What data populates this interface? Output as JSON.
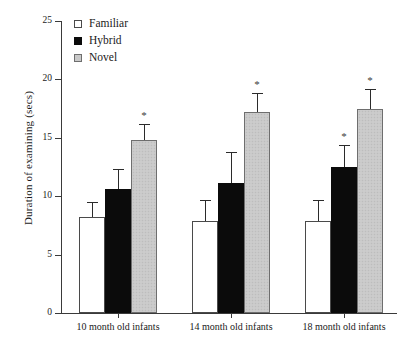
{
  "chart_data": {
    "type": "bar",
    "title": "",
    "xlabel": "",
    "ylabel": "Duration of examining (secs)",
    "ylim": [
      0,
      25
    ],
    "yticks": [
      0,
      5,
      10,
      15,
      20,
      25
    ],
    "grid": false,
    "legend_position": "top-left-inside",
    "categories": [
      "10 month old infants",
      "14 month old infants",
      "18 month old infants"
    ],
    "series": [
      {
        "name": "Familiar",
        "color": "#ffffff",
        "values": [
          8.2,
          7.9,
          7.9
        ],
        "errors": [
          1.3,
          1.8,
          1.8
        ],
        "significant": [
          false,
          false,
          false
        ]
      },
      {
        "name": "Hybrid",
        "color": "#0b0b0b",
        "values": [
          10.6,
          11.1,
          12.5
        ],
        "errors": [
          1.7,
          2.7,
          1.9
        ],
        "significant": [
          false,
          false,
          true
        ]
      },
      {
        "name": "Novel",
        "color": "#c9c9c9",
        "values": [
          14.8,
          17.2,
          17.5
        ],
        "errors": [
          1.4,
          1.6,
          1.7
        ],
        "significant": [
          true,
          true,
          true
        ]
      }
    ],
    "significance_marker": "*"
  },
  "legend": {
    "items": [
      {
        "label": "Familiar",
        "swatch": "open-square-icon"
      },
      {
        "label": "Hybrid",
        "swatch": "filled-square-icon"
      },
      {
        "label": "Novel",
        "swatch": "gray-square-icon"
      }
    ]
  }
}
